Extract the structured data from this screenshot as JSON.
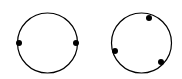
{
  "diagram": {
    "stroke_color": "#000000",
    "background": "#ffffff",
    "circles": [
      {
        "name": "left-circle",
        "cx": 47.5,
        "cy": 43,
        "r": 30,
        "points": [
          {
            "x": 19,
            "y": 43
          },
          {
            "x": 76,
            "y": 43
          }
        ]
      },
      {
        "name": "right-circle",
        "cx": 141.5,
        "cy": 43,
        "r": 30,
        "points": [
          {
            "x": 149,
            "y": 18
          },
          {
            "x": 115,
            "y": 51
          },
          {
            "x": 161,
            "y": 62
          }
        ]
      }
    ]
  }
}
